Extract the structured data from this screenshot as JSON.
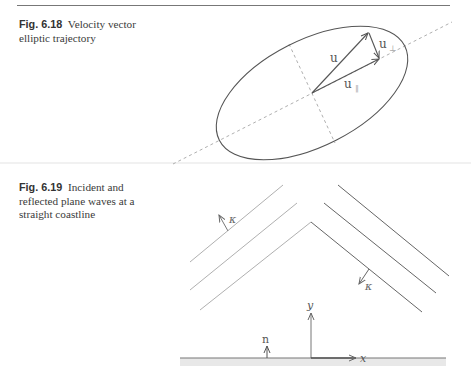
{
  "page": {
    "header_rule": true
  },
  "figures": [
    {
      "label": "Fig. 6.18",
      "caption": "Velocity vector elliptic trajectory",
      "caption_lines": [
        "Velocity vector",
        "elliptic trajectory"
      ],
      "symbols": {
        "u": "u",
        "u_parallel": "u",
        "u_parallel_sub": "‖",
        "u_perp": "u",
        "u_perp_sub": "⊥"
      }
    },
    {
      "label": "Fig. 6.19",
      "caption": "Incident and reflected plane waves at a straight coastline",
      "caption_lines": [
        "Incident and",
        "reflected plane waves at a",
        "straight coastline"
      ],
      "symbols": {
        "kappa_incident": "κ",
        "kappa_reflected": "κ",
        "normal": "n",
        "y_axis": "y",
        "x_axis": "x"
      }
    }
  ],
  "colors": {
    "ink": "#555555",
    "light_ink": "#aaaaaa",
    "dashed": "#999999",
    "coast_band": "#e6e6e6"
  }
}
